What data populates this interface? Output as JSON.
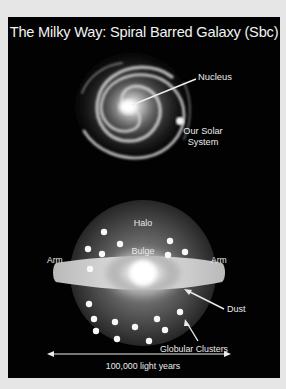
{
  "title": "The Milky Way:  Spiral Barred Galaxy (Sbc)",
  "top_view": {
    "labels": {
      "nucleus": "Nucleus",
      "solar_system_line1": "Our Solar",
      "solar_system_line2": "System"
    }
  },
  "side_view": {
    "labels": {
      "halo": "Halo",
      "bulge": "Bulge",
      "arm_left": "Arm",
      "arm_right": "Arm",
      "dust": "Dust",
      "globular_clusters": "Globular Clusters"
    }
  },
  "scale": {
    "label": "100,000 light years"
  },
  "colors": {
    "background": "#020202",
    "page": "#e6e6e6",
    "text": "#eaeaea"
  }
}
